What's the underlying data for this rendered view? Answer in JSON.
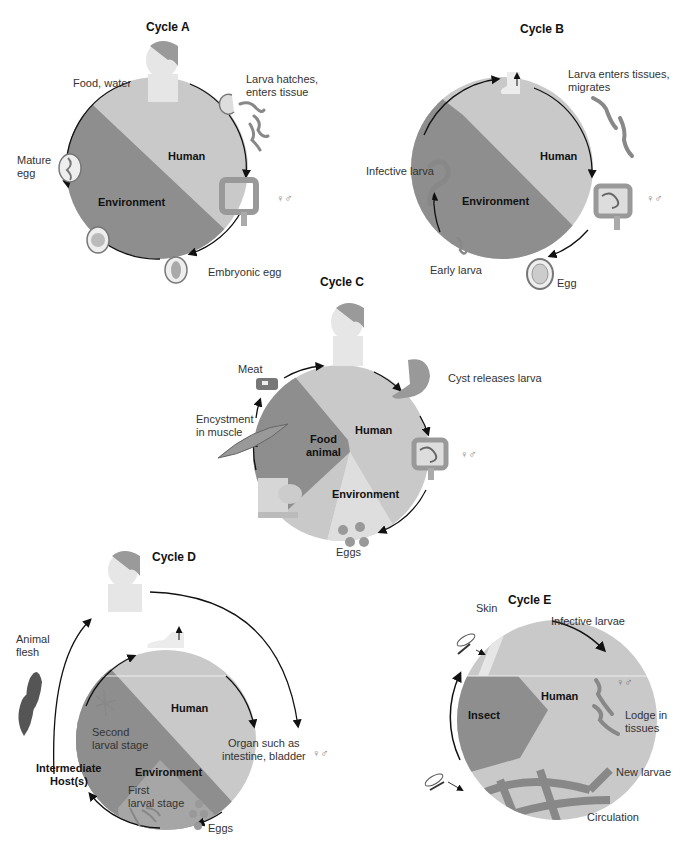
{
  "colors": {
    "human": "#c9c9c9",
    "environment": "#8e8e8e",
    "food_animal": "#8e8e8e",
    "intermediate": "#a6a6a6",
    "insect": "#8e8e8e",
    "arrow": "#111111"
  },
  "symbols": {
    "female_male": "♀♂"
  },
  "cycles": {
    "a": {
      "title": "Cycle A",
      "sectors": {
        "human": "Human",
        "environment": "Environment"
      },
      "labels": {
        "food_water": "Food, water",
        "larva_hatches": "Larva hatches,",
        "larva_hatches_2": "enters tissue",
        "mature_egg": "Mature",
        "mature_egg_2": "egg",
        "embryonic_egg": "Embryonic egg"
      }
    },
    "b": {
      "title": "Cycle B",
      "sectors": {
        "human": "Human",
        "environment": "Environment"
      },
      "labels": {
        "larva_enters": "Larva enters tissues,",
        "larva_enters_2": "migrates",
        "infective_larva": "Infective larva",
        "early_larva": "Early larva",
        "egg": "Egg"
      }
    },
    "c": {
      "title": "Cycle C",
      "sectors": {
        "human": "Human",
        "food_animal": "Food",
        "food_animal_2": "animal",
        "environment": "Environment"
      },
      "labels": {
        "meat": "Meat",
        "cyst_releases": "Cyst releases larva",
        "encystment": "Encystment",
        "encystment_2": "in muscle",
        "eggs": "Eggs"
      }
    },
    "d": {
      "title": "Cycle D",
      "sectors": {
        "human": "Human",
        "environment": "Environment",
        "intermediate": "Intermediate",
        "intermediate_2": "Host(s)"
      },
      "labels": {
        "animal_flesh": "Animal",
        "animal_flesh_2": "flesh",
        "second_larval": "Second",
        "second_larval_2": "larval stage",
        "organ": "Organ such as",
        "organ_2": "intestine,  bladder",
        "first_larval": "First",
        "first_larval_2": "larval stage",
        "eggs": "Eggs"
      }
    },
    "e": {
      "title": "Cycle E",
      "sectors": {
        "human": "Human",
        "insect": "Insect"
      },
      "labels": {
        "skin": "Skin",
        "infective_larvae": "Infective larvae",
        "lodge": "Lodge in",
        "lodge_2": "tissues",
        "new_larvae": "New larvae",
        "circulation": "Circulation"
      }
    }
  }
}
